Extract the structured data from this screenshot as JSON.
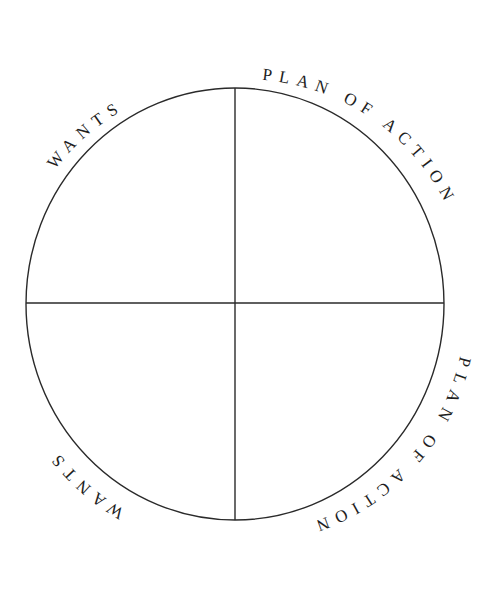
{
  "diagram": {
    "type": "four-quadrant circle",
    "stroke_color": "#2a2a2a",
    "text_color": "#1e1e1e",
    "background": "#ffffff",
    "labels": {
      "top_left": "WANTS",
      "top_right": "PLAN OF ACTION",
      "bottom_right": "PLAN OF ACTION",
      "bottom_left": "WANTS"
    },
    "quadrants": [
      {
        "position": "top-left",
        "content": ""
      },
      {
        "position": "top-right",
        "content": ""
      },
      {
        "position": "bottom-left",
        "content": ""
      },
      {
        "position": "bottom-right",
        "content": ""
      }
    ]
  }
}
